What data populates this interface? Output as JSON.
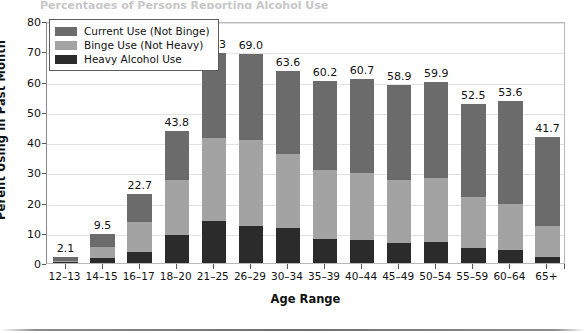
{
  "top_clipped_text": "Percentages of Persons Reporting Alcohol Use",
  "chart_data": {
    "type": "bar",
    "subtype": "stacked-bar",
    "title": "",
    "xlabel": "Age Range",
    "ylabel": "Perent Using in Past Month",
    "categories": [
      "12–13",
      "14–15",
      "16–17",
      "18–20",
      "21–25",
      "26–29",
      "30–34",
      "35–39",
      "40–44",
      "45–49",
      "50–54",
      "55–59",
      "60–64",
      "65+"
    ],
    "categories_note": "13 bars plotted; category list matches tick labels",
    "ylim": [
      0,
      80
    ],
    "yticks": [
      0,
      10,
      20,
      30,
      40,
      50,
      60,
      70,
      80
    ],
    "ytick_labels": [
      "0",
      "10",
      "20",
      "30",
      "40",
      "50",
      "60",
      "70",
      "80"
    ],
    "grid": true,
    "legend_position": "top-left-inside",
    "series": [
      {
        "name": "Current Use (Not Binge)",
        "color": "#6b6b6b",
        "values": [
          1.3,
          4.3,
          9.0,
          16.5,
          28.0,
          28.3,
          27.5,
          29.5,
          31.0,
          31.5,
          31.7,
          30.8,
          34.0,
          29.6
        ]
      },
      {
        "name": "Binge Use (Not Heavy)",
        "color": "#a3a3a3",
        "values": [
          0.6,
          3.7,
          10.2,
          18.2,
          27.5,
          28.5,
          24.5,
          22.6,
          22.0,
          20.8,
          21.4,
          16.9,
          15.2,
          10.0
        ]
      },
      {
        "name": "Heavy Alcohol Use",
        "color": "#2b2b2b",
        "values": [
          0.2,
          1.5,
          3.5,
          9.1,
          13.8,
          12.2,
          11.6,
          8.1,
          7.7,
          6.6,
          6.8,
          4.8,
          4.4,
          2.1
        ]
      }
    ],
    "totals": [
      2.1,
      9.5,
      22.7,
      43.8,
      69.3,
      69.0,
      63.6,
      60.2,
      60.7,
      58.9,
      59.9,
      52.5,
      53.6,
      41.7
    ],
    "total_labels": [
      "2.1",
      "9.5",
      "22.7",
      "43.8",
      "69.3",
      "69.0",
      "63.6",
      "60.2",
      "60.7",
      "58.9",
      "59.9",
      "52.5",
      "53.6",
      "41.7"
    ]
  },
  "legend": {
    "items": [
      {
        "label": "Current Use (Not Binge)",
        "key": "current"
      },
      {
        "label": "Binge Use (Not Heavy)",
        "key": "binge"
      },
      {
        "label": "Heavy Alcohol Use",
        "key": "heavy"
      }
    ]
  },
  "colors": {
    "current": "#6b6b6b",
    "binge": "#a3a3a3",
    "heavy": "#2b2b2b",
    "grid": "#e2e2e2",
    "axis": "#555555",
    "frame": "#b9b9b9"
  }
}
